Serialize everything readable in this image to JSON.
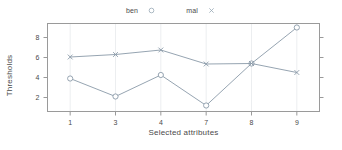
{
  "chart_data": {
    "type": "line",
    "title": "",
    "xlabel": "Selected attributes",
    "ylabel": "Thresholds",
    "categories": [
      "1",
      "3",
      "4",
      "7",
      "8",
      "9"
    ],
    "xtick_labels": [
      "1",
      "3",
      "4",
      "7",
      "8",
      "9"
    ],
    "ytick_labels": [
      "2",
      "4",
      "6",
      "8"
    ],
    "ytick_values": [
      2,
      4,
      6,
      8
    ],
    "ylim": [
      0.6,
      9.4
    ],
    "grid": "vertical-light",
    "legend_position": "top-center",
    "series": [
      {
        "name": "ben",
        "marker": "open-circle",
        "color": "#8a9aa8",
        "values": [
          3.9,
          2.1,
          4.25,
          1.2,
          5.4,
          9.0
        ]
      },
      {
        "name": "mal",
        "marker": "cross",
        "color": "#8a9aa8",
        "values": [
          6.05,
          6.3,
          6.75,
          5.35,
          5.4,
          4.5
        ]
      }
    ]
  },
  "legend": {
    "entries": [
      {
        "label": "ben",
        "marker": "circle-marker-icon"
      },
      {
        "label": "mal",
        "marker": "cross-marker-icon"
      }
    ]
  },
  "colors": {
    "frame": "#9a9a9a",
    "gridline": "#eceef0",
    "series_line": "#93a3b0",
    "text": "#4a4a4a",
    "background": "#ffffff"
  }
}
